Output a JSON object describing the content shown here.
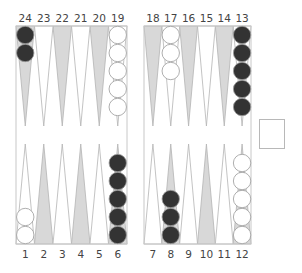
{
  "board": {
    "colors": {
      "frame": "#c8c8c8",
      "dark_point": "#d8d8d8",
      "light_point": "#ffffff",
      "point_stroke": "#b4b4b4",
      "black_checker": "#333333",
      "white_checker": "#ffffff",
      "checker_stroke": "#9a9a9a"
    },
    "top_labels": [
      "24",
      "23",
      "22",
      "21",
      "20",
      "19",
      "18",
      "17",
      "16",
      "15",
      "14",
      "13"
    ],
    "bottom_labels": [
      "1",
      "2",
      "3",
      "4",
      "5",
      "6",
      "7",
      "8",
      "9",
      "10",
      "11",
      "12"
    ],
    "points": [
      {
        "point": 1,
        "color": "white",
        "count": 2
      },
      {
        "point": 2,
        "color": null,
        "count": 0
      },
      {
        "point": 3,
        "color": null,
        "count": 0
      },
      {
        "point": 4,
        "color": null,
        "count": 0
      },
      {
        "point": 5,
        "color": null,
        "count": 0
      },
      {
        "point": 6,
        "color": "black",
        "count": 5
      },
      {
        "point": 7,
        "color": null,
        "count": 0
      },
      {
        "point": 8,
        "color": "black",
        "count": 3
      },
      {
        "point": 9,
        "color": null,
        "count": 0
      },
      {
        "point": 10,
        "color": null,
        "count": 0
      },
      {
        "point": 11,
        "color": null,
        "count": 0
      },
      {
        "point": 12,
        "color": "white",
        "count": 5
      },
      {
        "point": 13,
        "color": "black",
        "count": 5
      },
      {
        "point": 14,
        "color": null,
        "count": 0
      },
      {
        "point": 15,
        "color": null,
        "count": 0
      },
      {
        "point": 16,
        "color": null,
        "count": 0
      },
      {
        "point": 17,
        "color": "white",
        "count": 3
      },
      {
        "point": 18,
        "color": null,
        "count": 0
      },
      {
        "point": 19,
        "color": "white",
        "count": 5
      },
      {
        "point": 20,
        "color": null,
        "count": 0
      },
      {
        "point": 21,
        "color": null,
        "count": 0
      },
      {
        "point": 22,
        "color": null,
        "count": 0
      },
      {
        "point": 23,
        "color": null,
        "count": 0
      },
      {
        "point": 24,
        "color": "black",
        "count": 2
      }
    ]
  },
  "doubling_cube": {
    "value": ""
  }
}
